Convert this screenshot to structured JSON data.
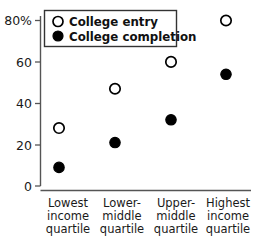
{
  "chart_data": {
    "type": "scatter",
    "title": "",
    "xlabel": "",
    "ylabel": "",
    "ylim": [
      0,
      80
    ],
    "grid": false,
    "legend_position": "top-left",
    "categories": [
      "Lowest income quartile",
      "Lower-middle quartile",
      "Upper-middle quartile",
      "Highest income quartile"
    ],
    "category_lines": [
      [
        "Lowest",
        "income",
        "quartile"
      ],
      [
        "Lower-",
        "middle",
        "quartile"
      ],
      [
        "Upper-",
        "middle",
        "quartile"
      ],
      [
        "Highest",
        "income",
        "quartile"
      ]
    ],
    "ytick_labels": [
      "80%",
      "60",
      "40",
      "20",
      "0"
    ],
    "ytick_values": [
      80,
      60,
      40,
      20,
      0
    ],
    "series": [
      {
        "name": "College entry",
        "marker": "open-circle",
        "color": "#000000",
        "values": [
          28,
          47,
          60,
          80
        ]
      },
      {
        "name": "College completion",
        "marker": "filled-circle",
        "color": "#000000",
        "values": [
          9,
          21,
          32,
          54
        ]
      }
    ]
  },
  "legend": {
    "entries": [
      {
        "label": "College entry",
        "marker": "open-circle"
      },
      {
        "label": "College completion",
        "marker": "filled-circle"
      }
    ]
  },
  "axis": {
    "y_labels": [
      "80%",
      "60",
      "40",
      "20",
      "0"
    ],
    "x_labels": [
      {
        "line1": "Lowest",
        "line2": "income",
        "line3": "quartile"
      },
      {
        "line1": "Lower-",
        "line2": "middle",
        "line3": "quartile"
      },
      {
        "line1": "Upper-",
        "line2": "middle",
        "line3": "quartile"
      },
      {
        "line1": "Highest",
        "line2": "income",
        "line3": "quartile"
      }
    ]
  },
  "colors": {
    "background": "#ffffff",
    "axis": "#555555",
    "marker": "#000000",
    "legend_border": "#333333"
  }
}
